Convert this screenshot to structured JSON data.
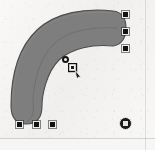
{
  "canvas": {
    "name": "drawing-canvas",
    "background_color": "#f2f1ef",
    "width": 155,
    "height": 150,
    "page_edge_color": "#787878"
  },
  "shape": {
    "name": "curved-band-path",
    "label": "Curved band",
    "fill_color": "#7e7e7e",
    "stroke_color": "#4c4c4c",
    "centerline_color": "#6a6a6a",
    "stroke_width": 1
  },
  "selection": {
    "label": "Selection handles",
    "handle_fill": "#121212",
    "handle_border": "#ededec",
    "square_handles": [
      {
        "name": "handle-bottom-left",
        "x": 16,
        "y": 121
      },
      {
        "name": "handle-bottom-center",
        "x": 33,
        "y": 121
      },
      {
        "name": "handle-bottom-right",
        "x": 49,
        "y": 121
      },
      {
        "name": "handle-top-right-upper",
        "x": 122,
        "y": 11
      },
      {
        "name": "handle-top-right-middle",
        "x": 122,
        "y": 28
      },
      {
        "name": "handle-top-right-lower",
        "x": 122,
        "y": 45
      }
    ],
    "circle_handles": [
      {
        "name": "handle-rotation-pivot",
        "x": 62,
        "y": 56
      }
    ],
    "origin_markers": [
      {
        "name": "origin-marker",
        "x": 119,
        "y": 117
      }
    ]
  },
  "cursor": {
    "name": "node-edit-cursor",
    "label": "Node edit pointer",
    "x": 68,
    "y": 63
  }
}
